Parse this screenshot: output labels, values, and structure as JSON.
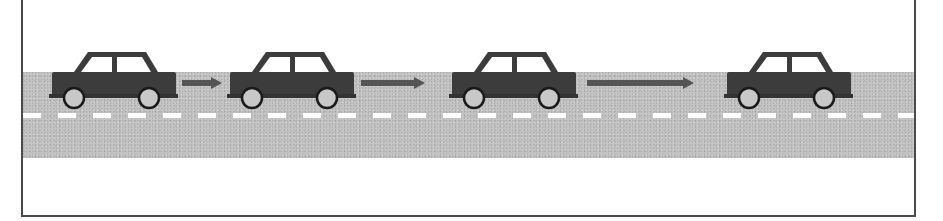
{
  "diagram": {
    "title": "",
    "colors": {
      "car_body": "#3c3c3c",
      "window": "#ffffff",
      "wheel": "#c8c8c8",
      "wheel_rim": "#1a1a1a",
      "road": "#c4c4c4",
      "lane_dash": "#ffffff",
      "arrow": "#555555",
      "frame": "#4a4a4a"
    },
    "cars": [
      {
        "id": "car-1",
        "x": 48
      },
      {
        "id": "car-2",
        "x": 226
      },
      {
        "id": "car-3",
        "x": 448
      },
      {
        "id": "car-4",
        "x": 723
      }
    ],
    "arrows": [
      {
        "id": "arrow-1",
        "x": 182,
        "length": 40
      },
      {
        "id": "arrow-2",
        "x": 361,
        "length": 64
      },
      {
        "id": "arrow-3",
        "x": 587,
        "length": 107
      }
    ]
  }
}
